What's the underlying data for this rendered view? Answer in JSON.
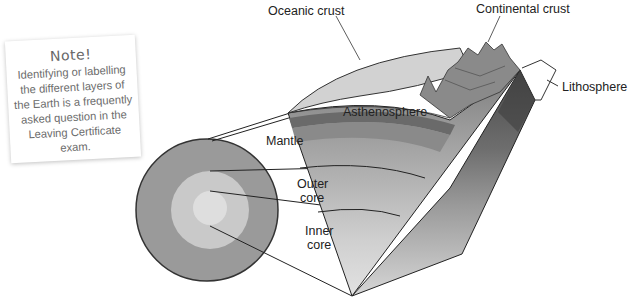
{
  "note": {
    "title": "Note!",
    "body": "Identifying or labelling the different layers of the Earth is a frequently asked question in the Leaving Certificate exam."
  },
  "labels": {
    "oceanic_crust": "Oceanic crust",
    "continental_crust": "Continental crust",
    "lithosphere": "Lithosphere",
    "asthenosphere": "Asthenosphere",
    "mantle": "Mantle",
    "outer_core_line1": "Outer",
    "outer_core_line2": "core",
    "inner_core_line1": "Inner",
    "inner_core_line2": "core"
  },
  "colors": {
    "mantle_disc": "#9a9a9a",
    "outer_core_disc": "#c8c8c8",
    "inner_core_disc": "#dddddd",
    "oceanic_crust_cap": "#d0d0d0",
    "asthenosphere": "#8c8c8c",
    "outline": "#2a2a2a"
  }
}
